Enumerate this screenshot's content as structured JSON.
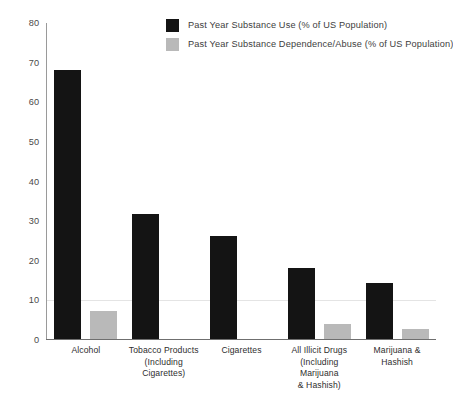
{
  "chart_data": {
    "type": "bar",
    "title": "",
    "subtitle": "",
    "xlabel": "",
    "ylabel": "",
    "ylim": [
      0,
      80
    ],
    "yticks": [
      0,
      10,
      20,
      30,
      40,
      50,
      60,
      70,
      80
    ],
    "grid": "horizontal-faint-at-10",
    "legend_position": "top-center",
    "categories": [
      "Alcohol",
      "Tobacco Products (Including Cigarettes)",
      "Cigarettes",
      "All Illicit Drugs (Including Marijuana & Hashish)",
      "Marijuana & Hashish"
    ],
    "category_lines": [
      [
        "Alcohol"
      ],
      [
        "Tobacco Products",
        "(Including Cigarettes)"
      ],
      [
        "Cigarettes"
      ],
      [
        "All Illicit Drugs",
        "(Including Marijuana",
        "& Hashish)"
      ],
      [
        "Marijuana & Hashish"
      ]
    ],
    "series": [
      {
        "name": "Past Year Substance Use (% of US Population)",
        "color": "#141414",
        "values": [
          67.8,
          31.6,
          26.0,
          18.0,
          14.2
        ]
      },
      {
        "name": "Past Year Substance Dependence/Abuse (% of US Population)",
        "color": "#b9b9b9",
        "values": [
          7.0,
          0,
          0,
          3.7,
          2.5
        ]
      }
    ]
  },
  "legend": {
    "items": [
      {
        "label": "Past Year Substance Use (% of US Population)",
        "color": "#141414"
      },
      {
        "label": "Past Year Substance Dependence/Abuse (% of US Population)",
        "color": "#b9b9b9"
      }
    ]
  }
}
